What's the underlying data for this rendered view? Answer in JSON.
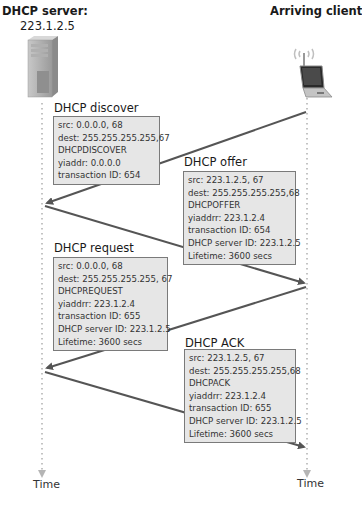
{
  "server": {
    "title": "DHCP server:",
    "address": "223.1.2.5",
    "icon": "server-tower-icon"
  },
  "client": {
    "title": "Arriving client",
    "icon": "wireless-laptop-icon"
  },
  "timeline": {
    "server_time_label": "Time",
    "client_time_label": "Time"
  },
  "colors": {
    "box_fill": "#e6e6e6",
    "box_border": "#7a7a7a",
    "arrow": "#555555",
    "timeline_dots": "#b5b5b5"
  },
  "messages": [
    {
      "label": "DHCP discover",
      "direction": "client-to-server",
      "lines": [
        "src: 0.0.0.0, 68",
        "dest: 255.255.255.255,67",
        "DHCPDISCOVER",
        "yiaddr: 0.0.0.0",
        "transaction ID: 654"
      ]
    },
    {
      "label": "DHCP offer",
      "direction": "server-to-client",
      "lines": [
        "src: 223.1.2.5, 67",
        "dest: 255.255.255.255,68",
        "DHCPOFFER",
        "yiaddrr: 223.1.2.4",
        "transaction ID: 654",
        "DHCP server ID: 223.1.2.5",
        "Lifetime: 3600 secs"
      ]
    },
    {
      "label": "DHCP request",
      "direction": "client-to-server",
      "lines": [
        "src: 0.0.0.0, 68",
        "dest: 255.255.255.255, 67",
        "DHCPREQUEST",
        "yiaddrr: 223.1.2.4",
        "transaction ID: 655",
        "DHCP server ID: 223.1.2.5",
        "Lifetime: 3600 secs"
      ]
    },
    {
      "label": "DHCP ACK",
      "direction": "server-to-client",
      "lines": [
        "src: 223.1.2.5, 67",
        "dest: 255.255.255.255,68",
        "DHCPACK",
        "yiaddrr: 223.1.2.4",
        "transaction ID: 655",
        "DHCP server ID: 223.1.2.5",
        "Lifetime: 3600 secs"
      ]
    }
  ]
}
